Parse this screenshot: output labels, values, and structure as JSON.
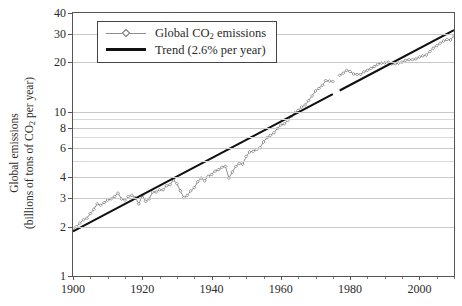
{
  "chart_data": {
    "type": "line",
    "title": "",
    "xlabel": "",
    "ylabel_line1": "Global emissions",
    "ylabel_line2_pre": "(billions of tons of CO",
    "ylabel_line2_sub": "2",
    "ylabel_line2_post": " per year)",
    "xlim": [
      1900,
      2010
    ],
    "ylim": [
      1,
      40
    ],
    "yscale": "log",
    "grid": true,
    "legend_position": "upper-left-inside",
    "yticks": [
      1,
      2,
      3,
      4,
      6,
      8,
      10,
      20,
      30,
      40
    ],
    "ytick_labels": [
      "1",
      "2",
      "3",
      "4",
      "6",
      "8",
      "10",
      "20",
      "30",
      "40"
    ],
    "gridline_values": [
      2,
      3,
      4,
      5,
      6,
      7,
      8,
      9,
      10,
      20,
      30
    ],
    "xticks": [
      1900,
      1920,
      1940,
      1960,
      1980,
      2000
    ],
    "xtick_labels": [
      "1900",
      "1920",
      "1940",
      "1960",
      "1980",
      "2000"
    ],
    "xminor_step": 5,
    "series": [
      {
        "name": "Global CO2 emissions",
        "legend_pre": "Global CO",
        "legend_sub": "2",
        "legend_post": " emissions",
        "color": "#8d8d8d",
        "marker": "open-diamond",
        "x": [
          1900,
          1901,
          1902,
          1903,
          1904,
          1905,
          1906,
          1907,
          1908,
          1909,
          1910,
          1911,
          1912,
          1913,
          1914,
          1915,
          1916,
          1917,
          1918,
          1919,
          1920,
          1921,
          1922,
          1923,
          1924,
          1925,
          1926,
          1927,
          1928,
          1929,
          1930,
          1931,
          1932,
          1933,
          1934,
          1935,
          1936,
          1937,
          1938,
          1939,
          1940,
          1941,
          1942,
          1943,
          1944,
          1945,
          1946,
          1947,
          1948,
          1949,
          1950,
          1951,
          1952,
          1953,
          1954,
          1955,
          1956,
          1957,
          1958,
          1959,
          1960,
          1961,
          1962,
          1963,
          1964,
          1965,
          1966,
          1967,
          1968,
          1969,
          1970,
          1971,
          1972,
          1973,
          1974,
          1975,
          1976,
          1977,
          1978,
          1979,
          1980,
          1981,
          1982,
          1983,
          1984,
          1985,
          1986,
          1987,
          1988,
          1989,
          1990,
          1991,
          1992,
          1993,
          1994,
          1995,
          1996,
          1997,
          1998,
          1999,
          2000,
          2001,
          2002,
          2003,
          2004,
          2005,
          2006,
          2007,
          2008,
          2009,
          2010
        ],
        "y": [
          1.95,
          2.0,
          2.1,
          2.2,
          2.25,
          2.4,
          2.55,
          2.75,
          2.7,
          2.8,
          2.9,
          2.95,
          3.05,
          3.2,
          2.95,
          2.9,
          3.05,
          3.1,
          3.0,
          2.75,
          3.1,
          2.85,
          2.95,
          3.25,
          3.25,
          3.35,
          3.35,
          3.55,
          3.6,
          3.85,
          3.65,
          3.3,
          3.0,
          3.1,
          3.3,
          3.45,
          3.75,
          3.95,
          3.8,
          4.05,
          4.15,
          4.35,
          4.45,
          4.6,
          4.65,
          3.95,
          4.3,
          4.65,
          4.85,
          4.8,
          5.35,
          5.7,
          5.75,
          5.9,
          6.05,
          6.55,
          6.95,
          7.2,
          7.45,
          7.9,
          8.3,
          8.45,
          8.85,
          9.35,
          9.85,
          10.2,
          10.7,
          11.0,
          11.7,
          12.5,
          13.4,
          13.9,
          14.5,
          15.5,
          15.4,
          15.3,
          16.2,
          16.7,
          17.2,
          17.9,
          17.6,
          17.0,
          16.9,
          16.9,
          17.5,
          17.9,
          18.4,
          18.9,
          19.5,
          19.8,
          19.9,
          20.1,
          19.6,
          19.6,
          19.8,
          20.1,
          20.6,
          20.8,
          20.8,
          21.0,
          21.6,
          21.9,
          22.2,
          23.3,
          24.4,
          25.3,
          26.2,
          27.0,
          27.6,
          27.4,
          29.0
        ],
        "break_after_year": 1975,
        "resume_year": 1977
      },
      {
        "name": "Trend (2.6% per year)",
        "legend_label": "Trend (2.6% per year)",
        "color": "#111111",
        "growth_rate_percent": 2.6,
        "start_year": 1900,
        "start_value": 1.87,
        "end_year": 2010,
        "end_value": 31.5,
        "break_after_year": 1975,
        "resume_year": 1977
      }
    ]
  }
}
